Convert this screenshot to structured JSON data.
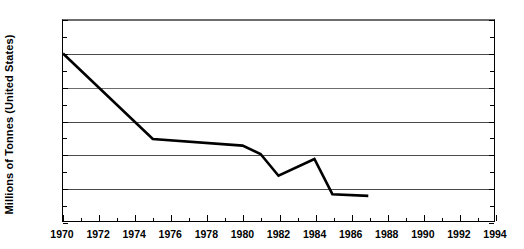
{
  "chart_data": {
    "type": "line",
    "title": "",
    "xlabel": "",
    "ylabel": "Millions of Tonnes (United States)",
    "xlim": [
      1970,
      1994
    ],
    "ylim": [
      2.0,
      14.0
    ],
    "grid": true,
    "legend": "none",
    "x_tick_labels": [
      "1970",
      "1972",
      "1974",
      "1976",
      "1978",
      "1980",
      "1982",
      "1984",
      "1986",
      "1988",
      "1990",
      "1992",
      "1994"
    ],
    "x_tick_values": [
      1970,
      1972,
      1974,
      1976,
      1978,
      1980,
      1982,
      1984,
      1986,
      1988,
      1990,
      1992,
      1994
    ],
    "x_minor_step": 1,
    "y_tick_labels": [
      "14.0",
      "12.0",
      "10.0",
      "8.0",
      "6.0",
      "4.0",
      "2.0"
    ],
    "y_tick_values": [
      14.0,
      12.0,
      10.0,
      8.0,
      6.0,
      4.0,
      2.0
    ],
    "y_minor_step": 1.0,
    "line_color": "#000000",
    "line_width": 2.6,
    "series": [
      {
        "name": "Millions of Tonnes (United States)",
        "x": [
          1970,
          1975,
          1980,
          1981,
          1982,
          1984,
          1985,
          1987
        ],
        "values": [
          12.0,
          6.9,
          6.5,
          6.0,
          4.7,
          5.7,
          3.6,
          3.5
        ]
      }
    ]
  }
}
